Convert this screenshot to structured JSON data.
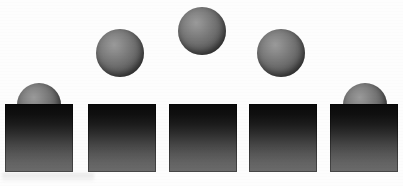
{
  "figure": {
    "title": "",
    "caption": "",
    "background_color": "#fdfdfd",
    "width": 403,
    "height": 186
  },
  "palette": {
    "box_top_color": "#0a0a0a",
    "box_bottom_color": "#6b6b6b",
    "sphere_highlight_color": "#9a9a9a",
    "sphere_shadow_color": "#2e2e2e",
    "page_background": "#fdfdfd"
  },
  "boxes": [
    {
      "id": "box-1",
      "label": "1",
      "x": 5,
      "y": 104,
      "width": 68,
      "height": 68
    },
    {
      "id": "box-2",
      "label": "2",
      "x": 88,
      "y": 104,
      "width": 68,
      "height": 68
    },
    {
      "id": "box-3",
      "label": "3",
      "x": 169,
      "y": 104,
      "width": 68,
      "height": 68
    },
    {
      "id": "box-4",
      "label": "4",
      "x": 249,
      "y": 104,
      "width": 68,
      "height": 68
    },
    {
      "id": "box-5",
      "label": "5",
      "x": 330,
      "y": 104,
      "width": 68,
      "height": 68
    }
  ],
  "spheres": [
    {
      "id": "sphere-1",
      "label": "1",
      "cx": 39,
      "cy": 105,
      "diameter": 44,
      "layer": "behind",
      "resting_on": "box-1"
    },
    {
      "id": "sphere-2",
      "label": "2",
      "cx": 120,
      "cy": 53,
      "diameter": 48,
      "layer": "behind",
      "resting_on": ""
    },
    {
      "id": "sphere-3",
      "label": "3",
      "cx": 202,
      "cy": 31,
      "diameter": 48,
      "layer": "behind",
      "resting_on": ""
    },
    {
      "id": "sphere-4",
      "label": "4",
      "cx": 281,
      "cy": 53,
      "diameter": 48,
      "layer": "behind",
      "resting_on": ""
    },
    {
      "id": "sphere-5",
      "label": "5",
      "cx": 365,
      "cy": 105,
      "diameter": 44,
      "layer": "behind",
      "resting_on": "box-5"
    }
  ]
}
